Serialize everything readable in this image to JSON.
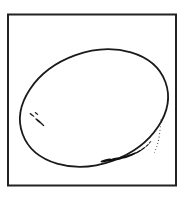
{
  "figure": {
    "title": "Egg",
    "style": "vintage line engraving",
    "background_color": "#ffffff",
    "ink_color": "#1a1a1a",
    "frame": {
      "name": "rectangular border",
      "x": 8,
      "y": 14.5,
      "width": 168,
      "height": 171,
      "stroke_width": 2.0,
      "stroke_color": "#222222",
      "fill": "none"
    },
    "egg": {
      "name": "egg outline",
      "shape": "tilted ellipse",
      "center_x": 94,
      "center_y": 108,
      "radius_x": 76,
      "radius_y": 56,
      "rotation_deg": -20,
      "stroke_width": 1.8,
      "stroke_color": "#1a1a1a",
      "fill": "#ffffff"
    },
    "shading": {
      "lower_left_marks": {
        "name": "lower-left hatch marks",
        "count": 4,
        "description": "short tapered dashes inside the lower-left rim",
        "marks": [
          {
            "x": 32.0,
            "y": 115.0,
            "len": 3.0,
            "w": 1.5,
            "rot": 38
          },
          {
            "x": 36.5,
            "y": 113.5,
            "len": 2.2,
            "w": 1.4,
            "rot": 38
          },
          {
            "x": 38.5,
            "y": 121.0,
            "len": 4.0,
            "w": 1.8,
            "rot": 40
          },
          {
            "x": 42.5,
            "y": 124.5,
            "len": 2.4,
            "w": 1.5,
            "rot": 42
          }
        ]
      },
      "bottom_right_marks": {
        "name": "bottom-right hatch marks",
        "count": 9,
        "description": "graded tapered dashes following the lower-right rim, heavy at left fading to fine at right",
        "marks": [
          {
            "x": 106.0,
            "y": 160.5,
            "len": 5.6,
            "w": 2.7,
            "rot": -14
          },
          {
            "x": 113.5,
            "y": 159.6,
            "len": 5.2,
            "w": 2.6,
            "rot": -16
          },
          {
            "x": 120.5,
            "y": 158.2,
            "len": 5.0,
            "w": 2.4,
            "rot": -19
          },
          {
            "x": 127.0,
            "y": 156.4,
            "len": 4.6,
            "w": 2.2,
            "rot": -22
          },
          {
            "x": 133.0,
            "y": 154.2,
            "len": 4.0,
            "w": 1.9,
            "rot": -26
          },
          {
            "x": 138.5,
            "y": 151.6,
            "len": 3.4,
            "w": 1.6,
            "rot": -31
          },
          {
            "x": 143.0,
            "y": 148.8,
            "len": 2.8,
            "w": 1.3,
            "rot": -36
          },
          {
            "x": 147.0,
            "y": 145.6,
            "len": 2.2,
            "w": 1.1,
            "rot": -42
          },
          {
            "x": 150.0,
            "y": 142.4,
            "len": 1.8,
            "w": 0.9,
            "rot": -48
          }
        ]
      },
      "right_dot_trail": {
        "name": "right-side stipple trail",
        "count": 11,
        "description": "fine vertical dotted line inside the right rim",
        "dots": [
          {
            "x": 160.6,
            "y": 120.0,
            "r": 0.45
          },
          {
            "x": 160.5,
            "y": 123.4,
            "r": 0.5
          },
          {
            "x": 160.3,
            "y": 126.8,
            "r": 0.5
          },
          {
            "x": 160.0,
            "y": 130.2,
            "r": 0.55
          },
          {
            "x": 159.6,
            "y": 133.6,
            "r": 0.55
          },
          {
            "x": 159.1,
            "y": 137.0,
            "r": 0.6
          },
          {
            "x": 158.5,
            "y": 140.3,
            "r": 0.6
          },
          {
            "x": 157.7,
            "y": 143.5,
            "r": 0.55
          },
          {
            "x": 156.8,
            "y": 146.6,
            "r": 0.5
          },
          {
            "x": 155.7,
            "y": 149.5,
            "r": 0.5
          },
          {
            "x": 154.4,
            "y": 152.2,
            "r": 0.45
          }
        ]
      }
    }
  }
}
